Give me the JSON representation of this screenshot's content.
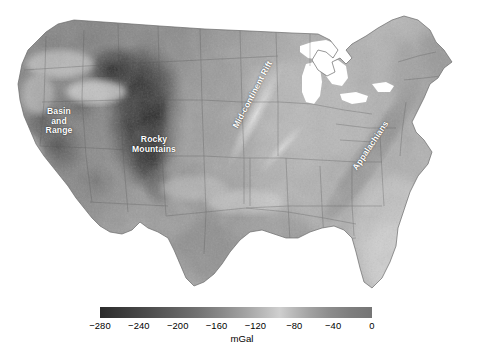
{
  "figure": {
    "type": "map",
    "cropped_caption_fragment": "  "
  },
  "map": {
    "name": "conterminous-united-states",
    "projection_hint": "conic",
    "annotations": [
      {
        "id": "basin-and-range",
        "label": "Basin\nand\nRange",
        "rotation_deg": 0,
        "color": "#ffffff"
      },
      {
        "id": "rocky-mountains",
        "label": "Rocky\nMountains",
        "rotation_deg": 0,
        "color": "#ffffff"
      },
      {
        "id": "mid-continent-rift",
        "label": "Mid-continent Rift",
        "rotation_deg": -62,
        "color": "#ffffff"
      },
      {
        "id": "appalachians",
        "label": "Appalachians",
        "rotation_deg": -56,
        "color": "#ffffff"
      }
    ]
  },
  "chart_data": {
    "type": "heatmap",
    "title": "",
    "xlabel": "",
    "ylabel": "",
    "colorbar": {
      "units": "mGal",
      "orientation": "horizontal",
      "colormap": "grayscale",
      "low_color": "#2b2b2b",
      "high_color": "#cfcfcf",
      "vmin": -280,
      "vmax": 0,
      "ticks": [
        -280,
        -240,
        -200,
        -160,
        -120,
        -80,
        -40,
        0
      ],
      "tick_labels": [
        "−280",
        "−240",
        "−200",
        "−160",
        "−120",
        "−80",
        "−40",
        "0"
      ]
    },
    "regional_values_mGal": [
      {
        "region": "Rocky Mountains (Colorado Plateau / Wyoming)",
        "value": -260
      },
      {
        "region": "Basin and Range",
        "value": -200
      },
      {
        "region": "Great Plains",
        "value": -130
      },
      {
        "region": "Mid-continent Rift",
        "value": -55
      },
      {
        "region": "Midwest / Interior Lowlands",
        "value": -40
      },
      {
        "region": "Appalachians",
        "value": -60
      },
      {
        "region": "Atlantic Coastal Plain",
        "value": -20
      },
      {
        "region": "Florida",
        "value": -10
      },
      {
        "region": "Gulf Coast / Texas",
        "value": -35
      },
      {
        "region": "Pacific Coast (California)",
        "value": -80
      }
    ]
  }
}
